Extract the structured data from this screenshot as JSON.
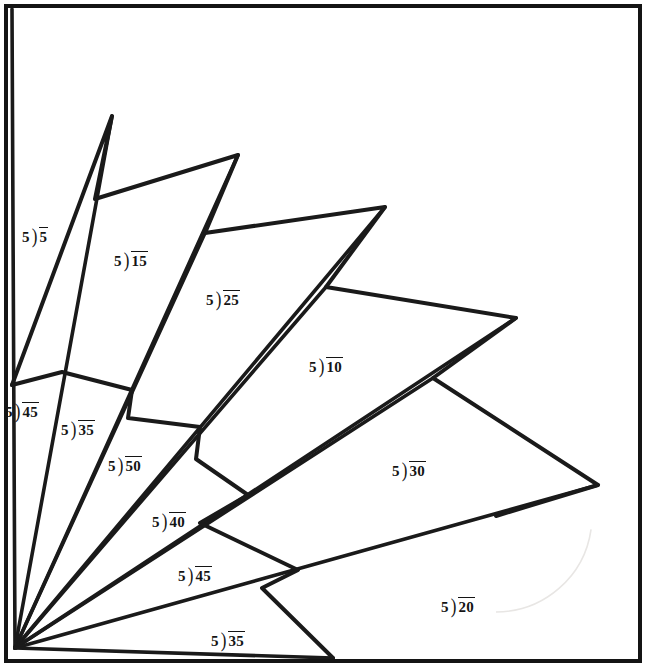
{
  "page": {
    "width": 646,
    "height": 667,
    "background": "#ffffff",
    "ink_color": "#1a1a1a",
    "faint_arc_color": "#e8e6e4",
    "border": {
      "color": "#141414",
      "width": 4,
      "inset": 6
    }
  },
  "figure": {
    "type": "ray-fan-with-zigzag",
    "origin": {
      "x": 15,
      "y": 648
    },
    "rays": [
      {
        "name": "ray-1",
        "x": 12,
        "y": 9
      },
      {
        "name": "ray-2",
        "x": 112,
        "y": 116
      },
      {
        "name": "ray-3",
        "x": 205,
        "y": 233
      },
      {
        "name": "ray-4",
        "x": 238,
        "y": 155
      },
      {
        "name": "ray-5",
        "x": 326,
        "y": 287
      },
      {
        "name": "ray-6",
        "x": 385,
        "y": 207
      },
      {
        "name": "ray-7",
        "x": 433,
        "y": 378
      },
      {
        "name": "ray-8",
        "x": 516,
        "y": 318
      },
      {
        "name": "ray-9",
        "x": 598,
        "y": 485
      },
      {
        "name": "ray-10",
        "x": 333,
        "y": 658
      }
    ],
    "zigzag": [
      {
        "x": 12,
        "y": 385
      },
      {
        "x": 112,
        "y": 116
      },
      {
        "x": 95,
        "y": 199
      },
      {
        "x": 238,
        "y": 155
      },
      {
        "x": 205,
        "y": 233
      },
      {
        "x": 385,
        "y": 207
      },
      {
        "x": 326,
        "y": 287
      },
      {
        "x": 516,
        "y": 318
      },
      {
        "x": 433,
        "y": 378
      },
      {
        "x": 598,
        "y": 485
      },
      {
        "x": 496,
        "y": 516
      }
    ],
    "inner_zigzag": [
      {
        "x": 12,
        "y": 385
      },
      {
        "x": 62,
        "y": 372
      },
      {
        "x": 132,
        "y": 390
      },
      {
        "x": 128,
        "y": 418
      },
      {
        "x": 200,
        "y": 427
      },
      {
        "x": 196,
        "y": 459
      },
      {
        "x": 248,
        "y": 495
      },
      {
        "x": 200,
        "y": 523
      },
      {
        "x": 298,
        "y": 570
      },
      {
        "x": 262,
        "y": 588
      },
      {
        "x": 333,
        "y": 658
      }
    ],
    "faint_arc": {
      "center": {
        "x": 496,
        "y": 516
      },
      "radius": 96,
      "start_angle": 90,
      "end_angle": 8
    }
  },
  "problems": [
    {
      "id": "p1",
      "divisor": "5",
      "dividend": "5",
      "text": "5)5",
      "x": 22,
      "y": 227
    },
    {
      "id": "p2",
      "divisor": "5",
      "dividend": "15",
      "text": "5)15",
      "x": 114,
      "y": 251
    },
    {
      "id": "p3",
      "divisor": "5",
      "dividend": "25",
      "text": "5)25",
      "x": 206,
      "y": 290
    },
    {
      "id": "p4",
      "divisor": "5",
      "dividend": "10",
      "text": "5)10",
      "x": 309,
      "y": 357
    },
    {
      "id": "p5",
      "divisor": "5",
      "dividend": "45",
      "text": "5)45",
      "x": 5,
      "y": 402
    },
    {
      "id": "p6",
      "divisor": "5",
      "dividend": "35",
      "text": "5)35",
      "x": 61,
      "y": 420
    },
    {
      "id": "p7",
      "divisor": "5",
      "dividend": "50",
      "text": "5)50",
      "x": 108,
      "y": 456
    },
    {
      "id": "p8",
      "divisor": "5",
      "dividend": "40",
      "text": "5)40",
      "x": 152,
      "y": 512
    },
    {
      "id": "p9",
      "divisor": "5",
      "dividend": "30",
      "text": "5)30",
      "x": 392,
      "y": 461
    },
    {
      "id": "p10",
      "divisor": "5",
      "dividend": "45",
      "text": "5)45",
      "x": 178,
      "y": 566
    },
    {
      "id": "p11",
      "divisor": "5",
      "dividend": "20",
      "text": "5)20",
      "x": 441,
      "y": 597
    },
    {
      "id": "p12",
      "divisor": "5",
      "dividend": "35",
      "text": "5)35",
      "x": 211,
      "y": 631
    }
  ]
}
